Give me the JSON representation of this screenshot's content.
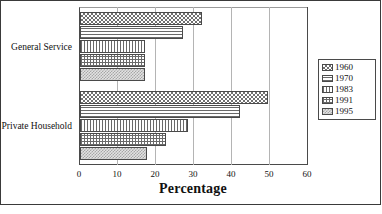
{
  "chart_data": {
    "type": "bar",
    "orientation": "horizontal",
    "title": "",
    "xlabel": "Percentage",
    "ylabel": "",
    "xlim": [
      0,
      60
    ],
    "xticks": [
      0,
      10,
      20,
      30,
      40,
      50,
      60
    ],
    "grid": true,
    "legend_position": "right",
    "categories": [
      "General Service",
      "Private Household"
    ],
    "series": [
      {
        "name": "1960",
        "values": [
          32,
          49.5
        ]
      },
      {
        "name": "1970",
        "values": [
          27,
          42
        ]
      },
      {
        "name": "1983",
        "values": [
          17,
          28.5
        ]
      },
      {
        "name": "1991",
        "values": [
          17,
          22.5
        ]
      },
      {
        "name": "1995",
        "values": [
          17,
          17.5
        ]
      }
    ]
  },
  "axis": {
    "x_title": "Percentage",
    "ticks": [
      {
        "label": "0",
        "value": 0
      },
      {
        "label": "10",
        "value": 10
      },
      {
        "label": "20",
        "value": 20
      },
      {
        "label": "30",
        "value": 30
      },
      {
        "label": "40",
        "value": 40
      },
      {
        "label": "50",
        "value": 50
      },
      {
        "label": "60",
        "value": 60
      }
    ]
  },
  "categories": [
    {
      "label": "General Service"
    },
    {
      "label": "Private Household"
    }
  ],
  "legend": {
    "items": [
      {
        "label": "1960",
        "pattern": "checker-dark"
      },
      {
        "label": "1970",
        "pattern": "horizontal-lines"
      },
      {
        "label": "1983",
        "pattern": "vertical-lines"
      },
      {
        "label": "1991",
        "pattern": "cross-hatch"
      },
      {
        "label": "1995",
        "pattern": "checker-light"
      }
    ]
  },
  "colors": {
    "frame": "#3a3a3a",
    "axis": "#4a4a4a",
    "gridline": "#b4b4b4",
    "bar_outline": "#4a4a4a",
    "background": "#ffffff"
  }
}
